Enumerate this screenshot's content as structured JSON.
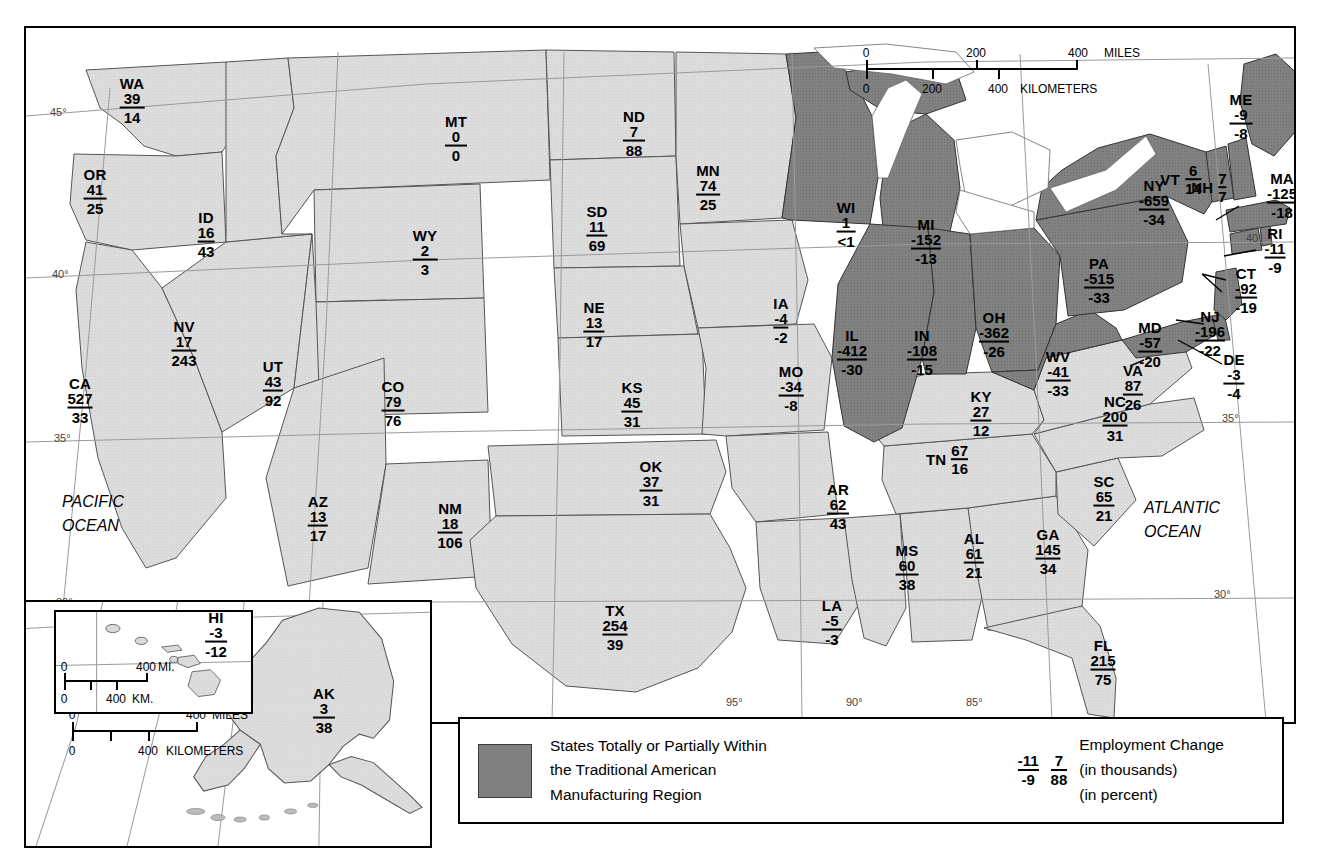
{
  "colors": {
    "manufacturing_region_fill": "#808080",
    "other_states_fill": "#dcdcdc",
    "water": "#ffffff",
    "outline": "#000000",
    "graticule": "#9a9a9a"
  },
  "legend": {
    "swatch_label_line1": "States Totally or Partially Within",
    "swatch_label_line2": "the Traditional American",
    "swatch_label_line3": "Manufacturing Region",
    "key_example_1": {
      "top": "-11",
      "bottom": "-9"
    },
    "key_example_2": {
      "top": "7",
      "bottom": "88"
    },
    "key_title": "Employment Change",
    "key_unit_top": "(in thousands)",
    "key_unit_bottom": "(in percent)"
  },
  "scale_main": {
    "miles": {
      "ticks": [
        "0",
        "200",
        "400"
      ],
      "unit": "MILES"
    },
    "kilometers": {
      "ticks": [
        "0",
        "200",
        "400"
      ],
      "unit": "KILOMETERS"
    }
  },
  "scale_alaska": {
    "miles": {
      "ticks": [
        "0",
        "400"
      ],
      "unit": "MILES"
    },
    "kilometers": {
      "ticks": [
        "0",
        "400"
      ],
      "unit": "KILOMETERS"
    }
  },
  "scale_hawaii": {
    "miles": {
      "ticks": [
        "0",
        "400"
      ],
      "unit": "MI."
    },
    "kilometers": {
      "ticks": [
        "0",
        "400"
      ],
      "unit": "KM."
    }
  },
  "ocean_labels": [
    {
      "name": "pacific-ocean-label",
      "line1": "PACIFIC",
      "line2": "OCEAN"
    },
    {
      "name": "atlantic-ocean-label",
      "line1": "ATLANTIC",
      "line2": "OCEAN"
    }
  ],
  "graticule_labels": {
    "left": [
      "45°",
      "40°",
      "35°",
      "30°"
    ],
    "right": [
      "40°",
      "35°",
      "30°"
    ],
    "bottom": [
      "120°",
      "95°",
      "90°",
      "85°"
    ]
  },
  "chart_data": {
    "type": "map",
    "value_labels": [
      "Employment Change (in thousands)",
      "Employment Change (in percent)"
    ],
    "categories": [
      "state"
    ],
    "states": [
      {
        "abbr": "WA",
        "thousands": "39",
        "percent": "14",
        "region": false
      },
      {
        "abbr": "OR",
        "thousands": "41",
        "percent": "25",
        "region": false
      },
      {
        "abbr": "CA",
        "thousands": "527",
        "percent": "33",
        "region": false
      },
      {
        "abbr": "NV",
        "thousands": "17",
        "percent": "243",
        "region": false
      },
      {
        "abbr": "ID",
        "thousands": "16",
        "percent": "43",
        "region": false
      },
      {
        "abbr": "MT",
        "thousands": "0",
        "percent": "0",
        "region": false
      },
      {
        "abbr": "WY",
        "thousands": "2",
        "percent": "3",
        "region": false
      },
      {
        "abbr": "UT",
        "thousands": "43",
        "percent": "92",
        "region": false
      },
      {
        "abbr": "AZ",
        "thousands": "13",
        "percent": "17",
        "region": false
      },
      {
        "abbr": "CO",
        "thousands": "79",
        "percent": "76",
        "region": false
      },
      {
        "abbr": "NM",
        "thousands": "18",
        "percent": "106",
        "region": false
      },
      {
        "abbr": "ND",
        "thousands": "7",
        "percent": "88",
        "region": false
      },
      {
        "abbr": "SD",
        "thousands": "11",
        "percent": "69",
        "region": false
      },
      {
        "abbr": "NE",
        "thousands": "13",
        "percent": "17",
        "region": false
      },
      {
        "abbr": "KS",
        "thousands": "45",
        "percent": "31",
        "region": false
      },
      {
        "abbr": "OK",
        "thousands": "37",
        "percent": "31",
        "region": false
      },
      {
        "abbr": "TX",
        "thousands": "254",
        "percent": "39",
        "region": false
      },
      {
        "abbr": "MN",
        "thousands": "74",
        "percent": "25",
        "region": false
      },
      {
        "abbr": "IA",
        "thousands": "-4",
        "percent": "-2",
        "region": false
      },
      {
        "abbr": "MO",
        "thousands": "-34",
        "percent": "-8",
        "region": false
      },
      {
        "abbr": "AR",
        "thousands": "62",
        "percent": "43",
        "region": false
      },
      {
        "abbr": "LA",
        "thousands": "-5",
        "percent": "-3",
        "region": false
      },
      {
        "abbr": "MS",
        "thousands": "60",
        "percent": "38",
        "region": false
      },
      {
        "abbr": "AL",
        "thousands": "61",
        "percent": "21",
        "region": false
      },
      {
        "abbr": "GA",
        "thousands": "145",
        "percent": "34",
        "region": false
      },
      {
        "abbr": "FL",
        "thousands": "215",
        "percent": "75",
        "region": false
      },
      {
        "abbr": "SC",
        "thousands": "65",
        "percent": "21",
        "region": false
      },
      {
        "abbr": "NC",
        "thousands": "200",
        "percent": "31",
        "region": false
      },
      {
        "abbr": "TN",
        "thousands": "67",
        "percent": "16",
        "region": false
      },
      {
        "abbr": "KY",
        "thousands": "27",
        "percent": "12",
        "region": false
      },
      {
        "abbr": "VA",
        "thousands": "87",
        "percent": "26",
        "region": false
      },
      {
        "abbr": "WI",
        "thousands": "1",
        "percent": "<1",
        "region": true
      },
      {
        "abbr": "MI",
        "thousands": "-152",
        "percent": "-13",
        "region": true
      },
      {
        "abbr": "IL",
        "thousands": "-412",
        "percent": "-30",
        "region": true
      },
      {
        "abbr": "IN",
        "thousands": "-108",
        "percent": "-15",
        "region": true
      },
      {
        "abbr": "OH",
        "thousands": "-362",
        "percent": "-26",
        "region": true
      },
      {
        "abbr": "WV",
        "thousands": "-41",
        "percent": "-33",
        "region": true
      },
      {
        "abbr": "PA",
        "thousands": "-515",
        "percent": "-33",
        "region": true
      },
      {
        "abbr": "NY",
        "thousands": "-659",
        "percent": "-34",
        "region": true
      },
      {
        "abbr": "MD",
        "thousands": "-57",
        "percent": "-20",
        "region": true
      },
      {
        "abbr": "DE",
        "thousands": "-3",
        "percent": "-4",
        "region": true
      },
      {
        "abbr": "NJ",
        "thousands": "-196",
        "percent": "-22",
        "region": true
      },
      {
        "abbr": "CT",
        "thousands": "-92",
        "percent": "-19",
        "region": true
      },
      {
        "abbr": "RI",
        "thousands": "-11",
        "percent": "-9",
        "region": true
      },
      {
        "abbr": "MA",
        "thousands": "-125",
        "percent": "-18",
        "region": true
      },
      {
        "abbr": "VT",
        "thousands": "6",
        "percent": "14",
        "region": true
      },
      {
        "abbr": "NH",
        "thousands": "7",
        "percent": "7",
        "region": true
      },
      {
        "abbr": "ME",
        "thousands": "-9",
        "percent": "-8",
        "region": true
      },
      {
        "abbr": "AK",
        "thousands": "3",
        "percent": "38",
        "region": false
      },
      {
        "abbr": "HI",
        "thousands": "-3",
        "percent": "-12",
        "region": false
      }
    ]
  },
  "states_positions": {
    "WA": {
      "x": 106,
      "y": 72,
      "style": "stack"
    },
    "OR": {
      "x": 69,
      "y": 163,
      "style": "stack"
    },
    "CA": {
      "x": 54,
      "y": 372,
      "style": "stack"
    },
    "NV": {
      "x": 158,
      "y": 315,
      "style": "stack"
    },
    "ID": {
      "x": 180,
      "y": 206,
      "style": "stack"
    },
    "MT": {
      "x": 430,
      "y": 110,
      "style": "stack"
    },
    "WY": {
      "x": 399,
      "y": 224,
      "style": "stack"
    },
    "UT": {
      "x": 247,
      "y": 355,
      "style": "stack"
    },
    "AZ": {
      "x": 292,
      "y": 490,
      "style": "stack"
    },
    "CO": {
      "x": 367,
      "y": 375,
      "style": "stack"
    },
    "NM": {
      "x": 424,
      "y": 497,
      "style": "stack"
    },
    "ND": {
      "x": 608,
      "y": 105,
      "style": "stack"
    },
    "SD": {
      "x": 571,
      "y": 200,
      "style": "stack"
    },
    "NE": {
      "x": 568,
      "y": 296,
      "style": "stack"
    },
    "KS": {
      "x": 606,
      "y": 376,
      "style": "stack"
    },
    "OK": {
      "x": 625,
      "y": 455,
      "style": "stack"
    },
    "TX": {
      "x": 589,
      "y": 599,
      "style": "stack"
    },
    "MN": {
      "x": 682,
      "y": 159,
      "style": "stack"
    },
    "IA": {
      "x": 755,
      "y": 292,
      "style": "stack"
    },
    "MO": {
      "x": 765,
      "y": 360,
      "style": "stack"
    },
    "AR": {
      "x": 812,
      "y": 478,
      "style": "stack"
    },
    "LA": {
      "x": 806,
      "y": 594,
      "style": "stack"
    },
    "MS": {
      "x": 881,
      "y": 539,
      "style": "stack"
    },
    "AL": {
      "x": 948,
      "y": 527,
      "style": "stack"
    },
    "GA": {
      "x": 1022,
      "y": 523,
      "style": "stack"
    },
    "FL": {
      "x": 1077,
      "y": 634,
      "style": "stack"
    },
    "SC": {
      "x": 1078,
      "y": 470,
      "style": "stack"
    },
    "NC": {
      "x": 1089,
      "y": 390,
      "style": "stack"
    },
    "TN": {
      "x": 921,
      "y": 432,
      "style": "horiz"
    },
    "KY": {
      "x": 955,
      "y": 385,
      "style": "stack"
    },
    "VA": {
      "x": 1107,
      "y": 359,
      "style": "stack"
    },
    "WI": {
      "x": 820,
      "y": 196,
      "style": "stack"
    },
    "MI": {
      "x": 900,
      "y": 213,
      "style": "stack"
    },
    "IL": {
      "x": 826,
      "y": 324,
      "style": "stack"
    },
    "IN": {
      "x": 896,
      "y": 324,
      "style": "stack"
    },
    "OH": {
      "x": 968,
      "y": 306,
      "style": "stack"
    },
    "WV": {
      "x": 1032,
      "y": 345,
      "style": "stack"
    },
    "PA": {
      "x": 1073,
      "y": 252,
      "style": "stack"
    },
    "NY": {
      "x": 1128,
      "y": 174,
      "style": "stack"
    },
    "MD": {
      "x": 1124,
      "y": 316,
      "style": "stack"
    },
    "DE": {
      "x": 1208,
      "y": 348,
      "style": "stack"
    },
    "NJ": {
      "x": 1184,
      "y": 305,
      "style": "stack"
    },
    "CT": {
      "x": 1220,
      "y": 262,
      "style": "stack"
    },
    "RI": {
      "x": 1249,
      "y": 222,
      "style": "stack"
    },
    "MA": {
      "x": 1256,
      "y": 167,
      "style": "stack"
    },
    "VT": {
      "x": 1155,
      "y": 152,
      "style": "horiz"
    },
    "NH": {
      "x": 1183,
      "y": 160,
      "style": "horiz"
    },
    "ME": {
      "x": 1215,
      "y": 88,
      "style": "stack"
    }
  }
}
